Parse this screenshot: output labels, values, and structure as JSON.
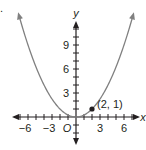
{
  "problem_marker": ".",
  "chart_data": {
    "type": "line",
    "title": "",
    "function": "y = x^2 / 4",
    "xlabel": "x",
    "ylabel": "y",
    "origin_label": "O",
    "xlim": [
      -7.7,
      7.7
    ],
    "ylim": [
      -3.3,
      12
    ],
    "x_ticks_every": 1,
    "y_ticks_every": 1,
    "x_tick_labels": [
      {
        "value": -6,
        "label": "−6"
      },
      {
        "value": -3,
        "label": "−3"
      },
      {
        "value": 3,
        "label": "3"
      },
      {
        "value": 6,
        "label": "6"
      }
    ],
    "y_tick_labels": [
      {
        "value": 3,
        "label": "3"
      },
      {
        "value": 6,
        "label": "6"
      },
      {
        "value": 9,
        "label": "9"
      }
    ],
    "series": [
      {
        "name": "parabola",
        "color": "#808080",
        "x": [
          -7,
          -6,
          -5,
          -4,
          -3,
          -2,
          -1,
          0,
          1,
          2,
          3,
          4,
          5,
          6,
          7
        ],
        "y": [
          12.25,
          9,
          6.25,
          4,
          2.25,
          1,
          0.25,
          0,
          0.25,
          1,
          2.25,
          4,
          6.25,
          9,
          12.25
        ]
      }
    ],
    "points": [
      {
        "x": 2,
        "y": 1,
        "label": "(2, 1)",
        "color": "#231f20"
      }
    ],
    "grid": false,
    "legend": null
  },
  "colors": {
    "axis": "#231f20",
    "curve": "#808080",
    "background": "#ffffff"
  }
}
